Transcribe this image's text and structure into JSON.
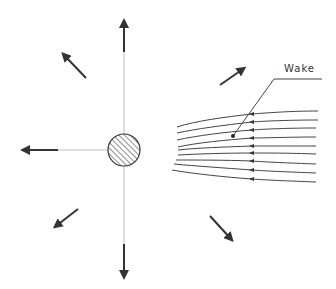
{
  "diagram": {
    "title": "",
    "labels": {
      "wake": "Wake"
    },
    "body": {
      "shape": "hatched-circle",
      "center": [
        124,
        150
      ],
      "radius": 16
    },
    "radial_arrows": [
      {
        "direction": "up",
        "from": [
          124,
          52
        ],
        "to": [
          124,
          20
        ]
      },
      {
        "direction": "down",
        "from": [
          124,
          244
        ],
        "to": [
          124,
          280
        ]
      },
      {
        "direction": "left",
        "from": [
          58,
          150
        ],
        "to": [
          22,
          150
        ]
      },
      {
        "direction": "up-left",
        "from": [
          86,
          78
        ],
        "to": [
          63,
          54
        ]
      },
      {
        "direction": "up-right",
        "from": [
          220,
          85
        ],
        "to": [
          244,
          68
        ]
      },
      {
        "direction": "down-left",
        "from": [
          78,
          209
        ],
        "to": [
          55,
          227
        ]
      },
      {
        "direction": "down-right",
        "from": [
          210,
          216
        ],
        "to": [
          232,
          240
        ]
      }
    ],
    "streamlines": {
      "count": 9,
      "flow_direction": "right-to-left",
      "arrowhead_x": 252
    },
    "colors": {
      "line": "#333333",
      "faint_line": "#bbbbbb"
    }
  }
}
